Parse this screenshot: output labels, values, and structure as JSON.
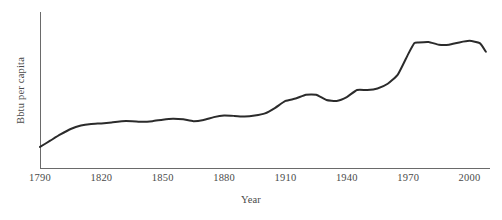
{
  "chart_data": {
    "type": "line",
    "title": "",
    "subtitle": "",
    "xlabel": "Year",
    "ylabel": "Bbtu per capita",
    "grid": false,
    "legend": false,
    "legend_position": "none",
    "annotations": [],
    "xlim": [
      1790,
      2010
    ],
    "ylim": [
      0,
      1
    ],
    "x_tick_labels": [
      "1790",
      "1820",
      "1850",
      "1880",
      "1910",
      "1940",
      "1970",
      "2000"
    ],
    "x_ticks": [
      1790,
      1820,
      1850,
      1880,
      1910,
      1940,
      1970,
      2000
    ],
    "y_tick_labels": [],
    "y_ticks": [],
    "line_color": "#2b2b2b",
    "axis_color": "#5a5a5a",
    "text_color": "#4a4a4a",
    "background_color": "#ffffff",
    "series": [
      {
        "name": "Bbtu per capita",
        "x": [
          1790,
          1795,
          1800,
          1805,
          1810,
          1815,
          1820,
          1825,
          1830,
          1835,
          1840,
          1845,
          1850,
          1855,
          1860,
          1865,
          1870,
          1875,
          1880,
          1885,
          1890,
          1895,
          1900,
          1905,
          1910,
          1915,
          1920,
          1925,
          1930,
          1935,
          1940,
          1945,
          1950,
          1955,
          1960,
          1965,
          1970,
          1973,
          1975,
          1980,
          1985,
          1990,
          1995,
          2000,
          2005,
          2008
        ],
        "y": [
          0.135,
          0.175,
          0.215,
          0.25,
          0.272,
          0.282,
          0.286,
          0.292,
          0.3,
          0.3,
          0.296,
          0.3,
          0.31,
          0.316,
          0.312,
          0.3,
          0.308,
          0.326,
          0.336,
          0.334,
          0.33,
          0.336,
          0.35,
          0.386,
          0.43,
          0.445,
          0.47,
          0.47,
          0.436,
          0.43,
          0.455,
          0.5,
          0.5,
          0.51,
          0.54,
          0.6,
          0.73,
          0.8,
          0.805,
          0.808,
          0.79,
          0.79,
          0.805,
          0.815,
          0.8,
          0.745
        ]
      }
    ]
  },
  "axes": {
    "y_axis_label": "Bbtu per capita",
    "x_axis_label": "Year"
  }
}
